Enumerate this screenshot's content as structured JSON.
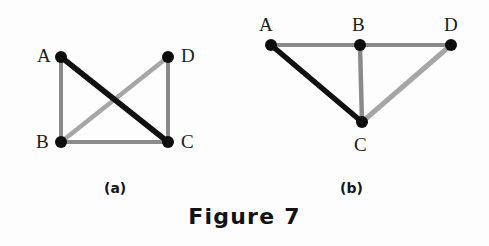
{
  "figure": {
    "caption": "Figure 7",
    "background_color": "#fdfdfd",
    "node_color": "#0d0d0d",
    "edge_dark_color": "#111111",
    "edge_gray_color": "#8a8a8a",
    "edge_light_gray_color": "#a6a6a6",
    "label_color": "#1b1b1b"
  },
  "panels": [
    {
      "key": "a",
      "label": "(a)",
      "label_x": 104,
      "label_y": 181,
      "nodes": [
        {
          "id": "A",
          "x": 61,
          "y": 57,
          "r": 6,
          "label": "A",
          "label_x": 37,
          "label_y": 46
        },
        {
          "id": "D",
          "x": 168,
          "y": 57,
          "r": 6,
          "label": "D",
          "label_x": 181,
          "label_y": 46
        },
        {
          "id": "B",
          "x": 61,
          "y": 142,
          "r": 6,
          "label": "B",
          "label_x": 36,
          "label_y": 132
        },
        {
          "id": "C",
          "x": 168,
          "y": 142,
          "r": 6,
          "label": "C",
          "label_x": 181,
          "label_y": 132
        }
      ],
      "edges": [
        {
          "from": "A",
          "to": "B",
          "style": "gray",
          "width": 4,
          "color": "#8a8a8a"
        },
        {
          "from": "D",
          "to": "C",
          "style": "gray",
          "width": 4,
          "color": "#8a8a8a"
        },
        {
          "from": "B",
          "to": "C",
          "style": "gray",
          "width": 4,
          "color": "#8a8a8a"
        },
        {
          "from": "B",
          "to": "D",
          "style": "light-gray",
          "width": 4.5,
          "color": "#a6a6a6"
        },
        {
          "from": "A",
          "to": "C",
          "style": "dark",
          "width": 5.5,
          "color": "#111111"
        }
      ]
    },
    {
      "key": "b",
      "label": "(b)",
      "label_x": 340,
      "label_y": 181,
      "nodes": [
        {
          "id": "A",
          "x": 271,
          "y": 45,
          "r": 6,
          "label": "A",
          "label_x": 259,
          "label_y": 15
        },
        {
          "id": "B",
          "x": 360,
          "y": 45,
          "r": 6,
          "label": "B",
          "label_x": 352,
          "label_y": 15
        },
        {
          "id": "D",
          "x": 451,
          "y": 45,
          "r": 6,
          "label": "D",
          "label_x": 444,
          "label_y": 15
        },
        {
          "id": "C",
          "x": 362,
          "y": 122,
          "r": 6,
          "label": "C",
          "label_x": 354,
          "label_y": 135
        }
      ],
      "edges": [
        {
          "from": "A",
          "to": "B",
          "style": "gray",
          "width": 4,
          "color": "#8a8a8a"
        },
        {
          "from": "B",
          "to": "D",
          "style": "gray",
          "width": 4,
          "color": "#8a8a8a"
        },
        {
          "from": "B",
          "to": "C",
          "style": "gray",
          "width": 4.5,
          "color": "#8a8a8a"
        },
        {
          "from": "C",
          "to": "D",
          "style": "light-gray",
          "width": 5,
          "color": "#a6a6a6"
        },
        {
          "from": "A",
          "to": "C",
          "style": "dark",
          "width": 5.5,
          "color": "#111111"
        }
      ]
    }
  ]
}
